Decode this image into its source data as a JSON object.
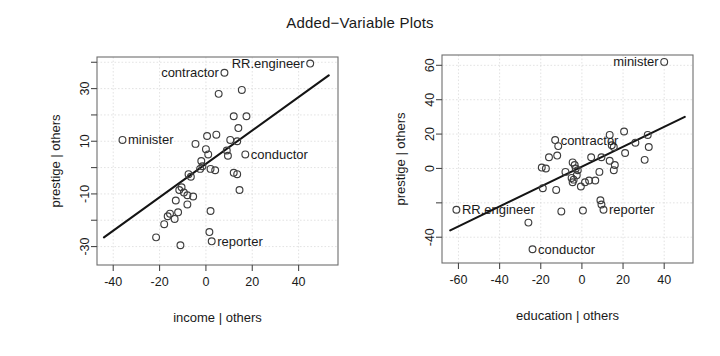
{
  "figure": {
    "title": "Added−Variable Plots",
    "background": "#ffffff",
    "point_color": "#3d3d3d",
    "line_color": "#141414",
    "grid_color": "#d7d7d7"
  },
  "chart_data": [
    {
      "type": "scatter",
      "id": "income",
      "title": "Added−Variable Plots",
      "xlabel": "income | others",
      "ylabel": "prestige | others",
      "xlim": [
        -47,
        57
      ],
      "ylim": [
        -37,
        42
      ],
      "xticks": [
        -40,
        -20,
        0,
        20,
        40
      ],
      "xticklabels": [
        "-40",
        "-20",
        "0",
        "20",
        "40"
      ],
      "yticks": [
        -30,
        -20,
        -10,
        0,
        10,
        20,
        30,
        40
      ],
      "yticklabels": [
        "-30",
        "",
        "-10",
        "",
        "10",
        "",
        "30",
        ""
      ],
      "grid": true,
      "legend": "none",
      "regression_line": {
        "x": [
          -44,
          53
        ],
        "y": [
          -26.5,
          35.0
        ]
      },
      "annotations": [
        {
          "label": "RR.engineer",
          "x": 45.0,
          "y": 39.5,
          "side": "left"
        },
        {
          "label": "contractor",
          "x": 8.0,
          "y": 36.0,
          "side": "left"
        },
        {
          "label": "minister",
          "x": -36.0,
          "y": 10.5,
          "side": "right"
        },
        {
          "label": "conductor",
          "x": 17.0,
          "y": 5.0,
          "side": "right"
        },
        {
          "label": "reporter",
          "x": 2.5,
          "y": -28.0,
          "side": "right"
        }
      ],
      "points": [
        {
          "x": 45.0,
          "y": 39.5
        },
        {
          "x": 8.0,
          "y": 36.0
        },
        {
          "x": -36.0,
          "y": 10.5
        },
        {
          "x": 17.0,
          "y": 5.0
        },
        {
          "x": 2.5,
          "y": -28.0
        },
        {
          "x": 15.5,
          "y": 29.5
        },
        {
          "x": 5.5,
          "y": 28.0
        },
        {
          "x": 12.0,
          "y": 19.5
        },
        {
          "x": 17.5,
          "y": 19.5
        },
        {
          "x": 14.0,
          "y": 15.0
        },
        {
          "x": 0.5,
          "y": 12.0
        },
        {
          "x": 4.5,
          "y": 12.5
        },
        {
          "x": 10.5,
          "y": 10.5
        },
        {
          "x": 13.5,
          "y": 10.0
        },
        {
          "x": -4.5,
          "y": 9.0
        },
        {
          "x": 0.0,
          "y": 7.0
        },
        {
          "x": 1.0,
          "y": 5.0
        },
        {
          "x": 9.0,
          "y": 6.5
        },
        {
          "x": 9.5,
          "y": 4.5
        },
        {
          "x": -2.0,
          "y": 2.5
        },
        {
          "x": -1.5,
          "y": 0.5
        },
        {
          "x": -2.5,
          "y": -0.5
        },
        {
          "x": 2.0,
          "y": -0.5
        },
        {
          "x": -7.5,
          "y": -2.5
        },
        {
          "x": -6.5,
          "y": -3.5
        },
        {
          "x": 4.0,
          "y": -1.0
        },
        {
          "x": 12.0,
          "y": -2.0
        },
        {
          "x": 13.5,
          "y": -2.5
        },
        {
          "x": -10.5,
          "y": -7.5
        },
        {
          "x": -11.5,
          "y": -8.5
        },
        {
          "x": -9.5,
          "y": -9.5
        },
        {
          "x": -8.0,
          "y": -10.5
        },
        {
          "x": -5.5,
          "y": -11.0
        },
        {
          "x": 14.5,
          "y": -8.5
        },
        {
          "x": -13.0,
          "y": -12.5
        },
        {
          "x": -8.0,
          "y": -14.0
        },
        {
          "x": -15.5,
          "y": -17.5
        },
        {
          "x": -16.5,
          "y": -18.5
        },
        {
          "x": -13.5,
          "y": -19.5
        },
        {
          "x": -12.0,
          "y": -17.0
        },
        {
          "x": -18.0,
          "y": -21.5
        },
        {
          "x": -21.5,
          "y": -26.5
        },
        {
          "x": -11.0,
          "y": -29.5
        },
        {
          "x": 2.0,
          "y": -16.5
        },
        {
          "x": 1.5,
          "y": -24.5
        }
      ]
    },
    {
      "type": "scatter",
      "id": "education",
      "title": "Added−Variable Plots",
      "xlabel": "education | others",
      "ylabel": "prestige | others",
      "xlim": [
        -68,
        54
      ],
      "ylim": [
        -55,
        66
      ],
      "xticks": [
        -60,
        -40,
        -20,
        0,
        20,
        40
      ],
      "xticklabels": [
        "-60",
        "-40",
        "-20",
        "0",
        "20",
        "40"
      ],
      "yticks": [
        -40,
        -20,
        0,
        20,
        40,
        60
      ],
      "yticklabels": [
        "-40",
        "",
        "0",
        "20",
        "40",
        "60"
      ],
      "grid": true,
      "legend": "none",
      "regression_line": {
        "x": [
          -64,
          50
        ],
        "y": [
          -36.0,
          30.0
        ]
      },
      "annotations": [
        {
          "label": "minister",
          "x": 40.0,
          "y": 62.0,
          "side": "left"
        },
        {
          "label": "contractor",
          "x": -13.0,
          "y": 16.5,
          "side": "right"
        },
        {
          "label": "RR.engineer",
          "x": -61.0,
          "y": -24.0,
          "side": "right"
        },
        {
          "label": "reporter",
          "x": 10.5,
          "y": -24.0,
          "side": "right"
        },
        {
          "label": "conductor",
          "x": -24.0,
          "y": -47.0,
          "side": "right"
        }
      ],
      "points": [
        {
          "x": 40.0,
          "y": 62.0
        },
        {
          "x": -13.0,
          "y": 16.5
        },
        {
          "x": -61.0,
          "y": -24.0
        },
        {
          "x": 10.5,
          "y": -24.0
        },
        {
          "x": -24.0,
          "y": -47.0
        },
        {
          "x": 20.5,
          "y": 21.5
        },
        {
          "x": 13.5,
          "y": 19.5
        },
        {
          "x": 32.0,
          "y": 19.5
        },
        {
          "x": 26.0,
          "y": 15.0
        },
        {
          "x": 14.5,
          "y": 13.5
        },
        {
          "x": 15.5,
          "y": 12.5
        },
        {
          "x": -11.5,
          "y": 13.0
        },
        {
          "x": 32.5,
          "y": 12.5
        },
        {
          "x": -16.0,
          "y": 6.5
        },
        {
          "x": -12.0,
          "y": 7.5
        },
        {
          "x": 4.5,
          "y": 6.5
        },
        {
          "x": 9.5,
          "y": 6.5
        },
        {
          "x": 21.0,
          "y": 9.0
        },
        {
          "x": 30.5,
          "y": 5.0
        },
        {
          "x": -19.5,
          "y": 0.5
        },
        {
          "x": -17.5,
          "y": 0.0
        },
        {
          "x": -4.5,
          "y": 3.5
        },
        {
          "x": -3.5,
          "y": 2.0
        },
        {
          "x": -3.0,
          "y": 0.0
        },
        {
          "x": -2.0,
          "y": -1.0
        },
        {
          "x": -8.0,
          "y": -2.0
        },
        {
          "x": 13.5,
          "y": 4.5
        },
        {
          "x": 16.0,
          "y": 2.0
        },
        {
          "x": 15.5,
          "y": -1.0
        },
        {
          "x": 8.5,
          "y": -2.0
        },
        {
          "x": -5.0,
          "y": -5.5
        },
        {
          "x": -4.0,
          "y": -6.5
        },
        {
          "x": -4.5,
          "y": -8.0
        },
        {
          "x": 1.5,
          "y": -8.0
        },
        {
          "x": 3.5,
          "y": -7.0
        },
        {
          "x": 6.5,
          "y": -7.0
        },
        {
          "x": -0.5,
          "y": -10.5
        },
        {
          "x": -19.0,
          "y": -11.5
        },
        {
          "x": -12.5,
          "y": -12.5
        },
        {
          "x": 9.0,
          "y": -18.5
        },
        {
          "x": 9.5,
          "y": -21.0
        },
        {
          "x": -26.0,
          "y": -31.5
        },
        {
          "x": -10.0,
          "y": -25.0
        },
        {
          "x": 0.5,
          "y": -24.5
        },
        {
          "x": -2.5,
          "y": -4.0
        }
      ]
    }
  ]
}
